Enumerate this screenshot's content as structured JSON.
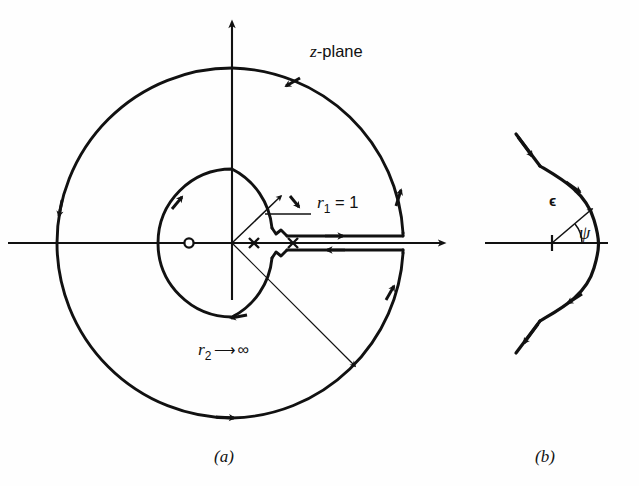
{
  "figure": {
    "background_color": "#fefefe",
    "ink_color": "#111111"
  },
  "panel_a": {
    "caption": "(a)",
    "plane_label_z": "z",
    "plane_label_rest": "-plane",
    "inner_radius_label_r": "r",
    "inner_radius_label_sub": "1",
    "inner_radius_label_eq": " = 1",
    "outer_radius_label_r": "r",
    "outer_radius_label_sub": "2",
    "outer_radius_label_arrow": "⟶",
    "outer_radius_label_infinity": "∞",
    "zero_marker": "o",
    "pole_marker_1": "×",
    "pole_marker_2": "×",
    "geometry": {
      "origin_x": 232,
      "origin_y": 243,
      "inner_radius": 74,
      "outer_radius": 175,
      "branch_cut_y_upper": 236,
      "branch_cut_y_lower": 250,
      "zero_x": 189,
      "pole_1_x": 254,
      "pole_2_x": 293,
      "real_axis_left": 8,
      "real_axis_right": 452,
      "imag_axis_top": 14
    }
  },
  "panel_b": {
    "caption": "(b)",
    "epsilon_label": "ϵ",
    "psi_label": "ψ",
    "geometry": {
      "center_x": 552,
      "center_y": 243,
      "radius": 56,
      "axis_left": 485,
      "angle_psi_degrees": 40
    }
  }
}
